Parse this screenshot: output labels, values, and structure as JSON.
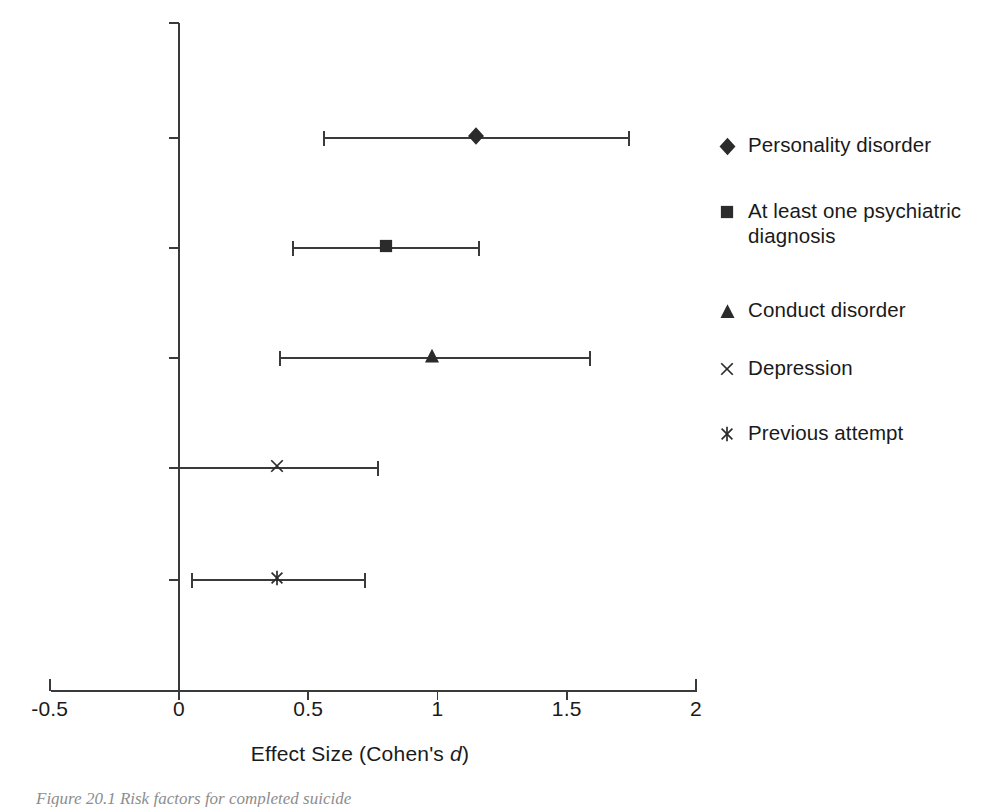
{
  "figure": {
    "caption": "Figure 20.1 Risk factors for completed suicide",
    "background": "#ffffff",
    "ink_color": "#1a1a1a"
  },
  "axes": {
    "x": {
      "label_prefix": "Effect Size (Cohen's ",
      "label_italic": "d",
      "label_suffix": ")",
      "full_label": "Effect Size (Cohen's d)",
      "ticks": [
        "-0.5",
        "0",
        "0.5",
        "1",
        "1.5",
        "2"
      ],
      "tick_values": [
        -0.5,
        0,
        0.5,
        1,
        1.5,
        2
      ],
      "range": [
        -0.5,
        2
      ]
    },
    "y": {
      "label": "",
      "ticks": [
        "",
        "",
        "",
        "",
        "",
        ""
      ]
    }
  },
  "legend": {
    "position": "right",
    "items": [
      {
        "label": "Personality disorder",
        "marker": "diamond-marker"
      },
      {
        "label": "At least one psychiatric diagnosis",
        "marker": "square-marker"
      },
      {
        "label": "Conduct disorder",
        "marker": "triangle-marker"
      },
      {
        "label": "Depression",
        "marker": "cross-marker"
      },
      {
        "label": "Previous attempt",
        "marker": "asterisk-marker"
      }
    ]
  },
  "chart_data": {
    "type": "scatter",
    "subtype": "forest-plot",
    "title": "",
    "xlabel": "Effect Size (Cohen's d)",
    "ylabel": "",
    "xlim": [
      -0.5,
      2
    ],
    "xticks": [
      -0.5,
      0,
      0.5,
      1,
      1.5,
      2
    ],
    "grid": false,
    "legend_position": "right",
    "categories": [
      "Personality disorder",
      "At least one psychiatric diagnosis",
      "Conduct disorder",
      "Depression",
      "Previous attempt"
    ],
    "points": [
      {
        "label": "Personality disorder",
        "marker": "diamond",
        "value": 1.15,
        "ci_low": 0.56,
        "ci_high": 1.74
      },
      {
        "label": "At least one psychiatric diagnosis",
        "marker": "square",
        "value": 0.8,
        "ci_low": 0.44,
        "ci_high": 1.16
      },
      {
        "label": "Conduct disorder",
        "marker": "triangle",
        "value": 0.98,
        "ci_low": 0.39,
        "ci_high": 1.59
      },
      {
        "label": "Depression",
        "marker": "cross",
        "value": 0.38,
        "ci_low": 0.0,
        "ci_high": 0.77
      },
      {
        "label": "Previous attempt",
        "marker": "asterisk",
        "value": 0.38,
        "ci_low": 0.05,
        "ci_high": 0.72
      }
    ]
  }
}
